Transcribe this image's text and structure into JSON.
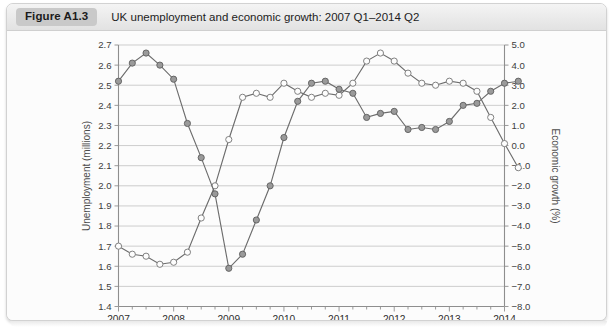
{
  "figure": {
    "badge": "Figure A1.3",
    "title": "UK unemployment and economic growth: 2007 Q1–2014 Q2"
  },
  "chart_data": {
    "type": "line",
    "title": "UK unemployment and economic growth: 2007 Q1–2014 Q2",
    "xlabel": "",
    "ylabel": "Unemployment (millions)",
    "y2label": "Economic growth (%)",
    "ylim": [
      1.4,
      2.7
    ],
    "y2lim": [
      -8.0,
      5.0
    ],
    "grid": true,
    "legend_position": "none",
    "x_tick_labels": [
      "2007",
      "2008",
      "2009",
      "2010",
      "2011",
      "2012",
      "2013",
      "2014"
    ],
    "x_minor_ticks_per_year": 4,
    "y_tick_labels": [
      "1.4",
      "1.5",
      "1.6",
      "1.7",
      "1.8",
      "1.9",
      "2.0",
      "2.1",
      "2.2",
      "2.3",
      "2.4",
      "2.5",
      "2.6",
      "2.7"
    ],
    "y2_tick_labels": [
      "-8.0",
      "-7.0",
      "-6.0",
      "-5.0",
      "-4.0",
      "-3.0",
      "-2.0",
      "-1.0",
      "0.0",
      "1.0",
      "2.0",
      "3.0",
      "4.0",
      "5.0"
    ],
    "x": [
      "2007 Q1",
      "2007 Q2",
      "2007 Q3",
      "2007 Q4",
      "2008 Q1",
      "2008 Q2",
      "2008 Q3",
      "2008 Q4",
      "2009 Q1",
      "2009 Q2",
      "2009 Q3",
      "2009 Q4",
      "2010 Q1",
      "2010 Q2",
      "2010 Q3",
      "2010 Q4",
      "2011 Q1",
      "2011 Q2",
      "2011 Q3",
      "2011 Q4",
      "2012 Q1",
      "2012 Q2",
      "2012 Q3",
      "2012 Q4",
      "2013 Q1",
      "2013 Q2",
      "2013 Q3",
      "2013 Q4",
      "2014 Q1",
      "2014 Q2"
    ],
    "series": [
      {
        "name": "Unemployment (millions)",
        "axis": "left",
        "marker": "open-circle",
        "color": "#7a7a7a",
        "values": [
          1.7,
          1.66,
          1.65,
          1.61,
          1.62,
          1.67,
          1.84,
          2.0,
          2.23,
          2.44,
          2.46,
          2.44,
          2.51,
          2.47,
          2.44,
          2.46,
          2.45,
          2.51,
          2.62,
          2.66,
          2.62,
          2.56,
          2.51,
          2.5,
          2.52,
          2.51,
          2.47,
          2.34,
          2.21,
          2.09
        ]
      },
      {
        "name": "Economic growth (%)",
        "axis": "right",
        "marker": "filled-circle",
        "color": "#9a9a9a",
        "values": [
          3.2,
          4.1,
          4.6,
          4.0,
          3.3,
          1.1,
          -0.6,
          -2.4,
          -6.1,
          -5.4,
          -3.7,
          -2.0,
          0.4,
          2.2,
          3.1,
          3.2,
          2.8,
          2.6,
          1.4,
          1.6,
          1.7,
          0.8,
          0.9,
          0.8,
          1.2,
          2.0,
          2.1,
          2.7,
          3.1,
          3.2
        ]
      }
    ]
  },
  "source_note": ""
}
